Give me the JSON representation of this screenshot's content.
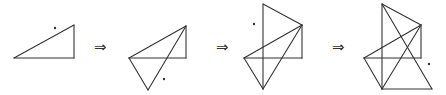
{
  "diagram": {
    "stroke_color": "#333333",
    "arrows": [
      {
        "symbol": "⇒",
        "x": 94,
        "y": 40
      },
      {
        "symbol": "⇒",
        "x": 216,
        "y": 40
      },
      {
        "symbol": "⇒",
        "x": 332,
        "y": 40
      }
    ],
    "figures": [
      {
        "name": "step-1",
        "segments": [
          [
            14,
            58,
            74,
            25
          ],
          [
            74,
            25,
            74,
            58
          ],
          [
            14,
            58,
            74,
            58
          ]
        ],
        "dot": [
          55,
          28
        ]
      },
      {
        "name": "step-2",
        "segments": [
          [
            129,
            58,
            186,
            26
          ],
          [
            186,
            26,
            186,
            58
          ],
          [
            129,
            58,
            186,
            58
          ],
          [
            129,
            58,
            148,
            90
          ],
          [
            148,
            90,
            186,
            26
          ]
        ],
        "dot": [
          164,
          79
        ]
      },
      {
        "name": "step-3",
        "segments": [
          [
            263,
            4,
            302,
            25
          ],
          [
            302,
            25,
            302,
            58
          ],
          [
            244,
            58,
            302,
            58
          ],
          [
            244,
            58,
            302,
            25
          ],
          [
            244,
            58,
            263,
            89
          ],
          [
            263,
            89,
            302,
            25
          ],
          [
            263,
            4,
            263,
            89
          ]
        ],
        "dot": [
          254,
          24
        ]
      },
      {
        "name": "step-4",
        "segments": [
          [
            382,
            4,
            421,
            25
          ],
          [
            421,
            25,
            421,
            58
          ],
          [
            364,
            58,
            421,
            58
          ],
          [
            364,
            58,
            421,
            25
          ],
          [
            364,
            58,
            382,
            89
          ],
          [
            382,
            89,
            421,
            25
          ],
          [
            382,
            4,
            382,
            89
          ],
          [
            382,
            4,
            432,
            89
          ],
          [
            382,
            89,
            432,
            89
          ]
        ],
        "dot": [
          429,
          64
        ]
      }
    ]
  }
}
